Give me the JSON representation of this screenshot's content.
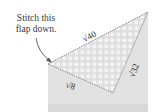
{
  "diagram": {
    "caption_line1": "Stitch this",
    "caption_line2": "flap down.",
    "side_hypotenuse": "√40",
    "side_right": "√32",
    "side_left": "√8",
    "colors": {
      "paper": "#e2e2e2",
      "flap": "#f2f2f2",
      "plaid": "#d9d9d9",
      "edge": "#8a8a8a",
      "text": "#333333"
    }
  }
}
